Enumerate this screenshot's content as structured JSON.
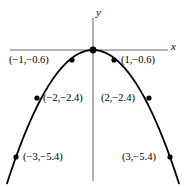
{
  "figure": {
    "type": "graph",
    "width": 189,
    "height": 187,
    "background": "#ffffff",
    "curve_color": "#000000",
    "axis_color": "#9a9a9a",
    "point_color": "#000000"
  },
  "axes": {
    "x_label": "x",
    "y_label": "y",
    "x_axis": {
      "x1": 10,
      "y1": 50,
      "x2": 168,
      "y2": 50
    },
    "y_axis": {
      "x1": 93,
      "y1": 18,
      "x2": 93,
      "y2": 181
    },
    "x_label_pos": {
      "x": 171,
      "y": 41
    },
    "y_label_pos": {
      "x": 96,
      "y": 7
    }
  },
  "chart_data": {
    "type": "scatter",
    "title": "",
    "xlabel": "x",
    "ylabel": "y",
    "grid": false,
    "legend": null,
    "curve": "downward parabola through origin",
    "x": [
      -3,
      -2,
      -1,
      0,
      1,
      2,
      3
    ],
    "y": [
      -5.4,
      -2.4,
      -0.6,
      0,
      -0.6,
      -2.4,
      -5.4
    ],
    "xlim": [
      -3.6,
      3.6
    ],
    "ylim": [
      -6.4,
      0.8
    ],
    "points": [
      {
        "label": "(−1,−0.6)",
        "x": -1,
        "y": -0.6,
        "px": 72,
        "py": 60,
        "label_x": 9,
        "label_y": 55,
        "label_align": "left"
      },
      {
        "label": "(1,−0.6)",
        "x": 1,
        "y": -0.6,
        "px": 114,
        "py": 60,
        "label_x": 121,
        "label_y": 55,
        "label_align": "left"
      },
      {
        "label": "(−2,−2.4)",
        "x": -2,
        "y": -2.4,
        "px": 37,
        "py": 98,
        "label_x": 43,
        "label_y": 93,
        "label_align": "left"
      },
      {
        "label": "(2,−2.4)",
        "x": 2,
        "y": -2.4,
        "px": 149,
        "py": 98,
        "label_x": 101,
        "label_y": 93,
        "label_align": "left"
      },
      {
        "label": "(−3,−5.4)",
        "x": -3,
        "y": -5.4,
        "px": 16,
        "py": 157,
        "label_x": 23,
        "label_y": 152,
        "label_align": "left"
      },
      {
        "label": "(3,−5.4)",
        "x": 3,
        "y": -5.4,
        "px": 170,
        "py": 157,
        "label_x": 122,
        "label_y": 152,
        "label_align": "left"
      },
      {
        "label": "",
        "x": 0,
        "y": 0,
        "px": 93,
        "py": 50,
        "label_x": 0,
        "label_y": 0,
        "label_align": "left"
      }
    ]
  }
}
